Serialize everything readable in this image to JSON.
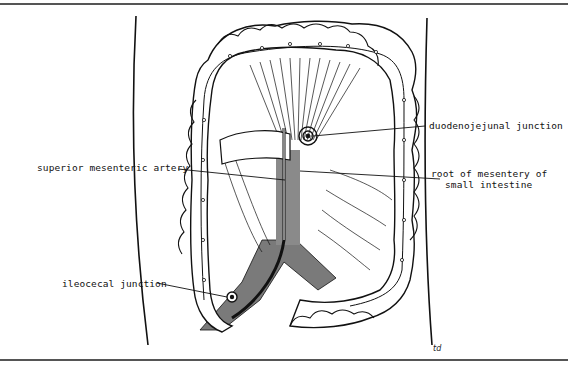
{
  "diagram": {
    "labels": {
      "duodenojejunal": "duodenojejunal junction",
      "sma": "superior mesenteric artery",
      "root_line1": "root of mesentery of",
      "root_line2": "small intestine",
      "ileocecal": "ileocecal junction"
    },
    "signature": "td"
  },
  "colors": {
    "ink": "#111111",
    "shading": "#7a7a7a",
    "background": "#ffffff"
  }
}
